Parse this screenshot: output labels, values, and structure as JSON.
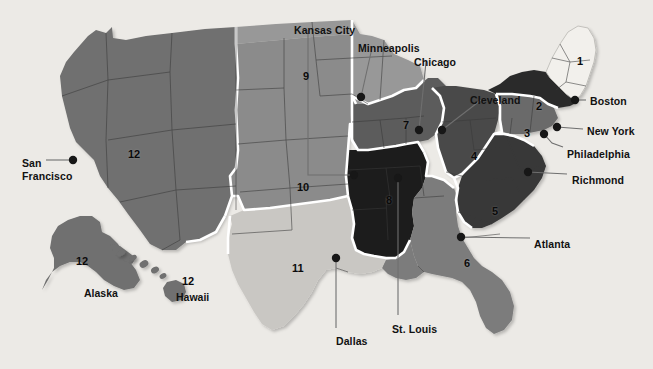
{
  "figure": {
    "kind": "map",
    "background_color": "#eceae6",
    "outline_color": "#ffffff",
    "state_border_color": "#3a3a3a",
    "marker_color": "#171717",
    "leader_line_color": "#6b6b6b"
  },
  "district_shades": {
    "1": "#f2f0ec",
    "2": "#2b2b2b",
    "3": "#6a6a6a",
    "4": "#4a4a4a",
    "5": "#383838",
    "6": "#7c7c7c",
    "7": "#5c5c5c",
    "8": "#1d1d1d",
    "9": "#989898",
    "10": "#8b8b8b",
    "11": "#c9c7c3",
    "12": "#6f6f6f"
  },
  "districts": [
    {
      "number": "1",
      "label_x": 577,
      "label_y": 55,
      "tone": "light"
    },
    {
      "number": "2",
      "label_x": 536,
      "label_y": 100,
      "tone": "dark"
    },
    {
      "number": "3",
      "label_x": 524,
      "label_y": 127,
      "tone": "dark"
    },
    {
      "number": "4",
      "label_x": 471,
      "label_y": 150,
      "tone": "dark"
    },
    {
      "number": "5",
      "label_x": 492,
      "label_y": 205,
      "tone": "dark"
    },
    {
      "number": "6",
      "label_x": 464,
      "label_y": 257,
      "tone": "dark"
    },
    {
      "number": "7",
      "label_x": 403,
      "label_y": 119,
      "tone": "dark"
    },
    {
      "number": "8",
      "label_x": 386,
      "label_y": 194,
      "tone": "dark"
    },
    {
      "number": "9",
      "label_x": 303,
      "label_y": 70,
      "tone": "light"
    },
    {
      "number": "10",
      "label_x": 297,
      "label_y": 181,
      "tone": "light"
    },
    {
      "number": "11",
      "label_x": 292,
      "label_y": 262,
      "tone": "light"
    },
    {
      "number": "12",
      "label_x": 128,
      "label_y": 148,
      "tone": "dark"
    }
  ],
  "inset_districts": [
    {
      "number": "12",
      "label_x": 76,
      "label_y": 255,
      "region": "alaska"
    },
    {
      "number": "12",
      "label_x": 182,
      "label_y": 275,
      "region": "hawaii"
    }
  ],
  "inset_labels": [
    {
      "name": "Alaska",
      "x": 84,
      "y": 287
    },
    {
      "name": "Hawaii",
      "x": 176,
      "y": 291
    }
  ],
  "cities": [
    {
      "name": "Kansas City",
      "label_x": 294,
      "label_y": 24,
      "dot_x": 354,
      "dot_y": 175,
      "anchor": "label-left"
    },
    {
      "name": "Minneapolis",
      "label_x": 358,
      "label_y": 42,
      "dot_x": 361,
      "dot_y": 97,
      "anchor": "label-left"
    },
    {
      "name": "Chicago",
      "label_x": 414,
      "label_y": 56,
      "dot_x": 419,
      "dot_y": 130,
      "anchor": "label-left"
    },
    {
      "name": "Cleveland",
      "label_x": 470,
      "label_y": 94,
      "dot_x": 442,
      "dot_y": 130,
      "anchor": "label-left"
    },
    {
      "name": "Boston",
      "label_x": 590,
      "label_y": 95,
      "dot_x": 575,
      "dot_y": 100,
      "anchor": "label-right"
    },
    {
      "name": "New York",
      "label_x": 587,
      "label_y": 125,
      "dot_x": 557,
      "dot_y": 127,
      "anchor": "label-right"
    },
    {
      "name": "Philadelphia",
      "label_x": 567,
      "label_y": 148,
      "dot_x": 544,
      "dot_y": 134,
      "anchor": "label-right"
    },
    {
      "name": "Richmond",
      "label_x": 572,
      "label_y": 174,
      "dot_x": 528,
      "dot_y": 172,
      "anchor": "label-right"
    },
    {
      "name": "Atlanta",
      "label_x": 534,
      "label_y": 238,
      "dot_x": 461,
      "dot_y": 237,
      "anchor": "label-right"
    },
    {
      "name": "St. Louis",
      "label_x": 392,
      "label_y": 323,
      "dot_x": 398,
      "dot_y": 178,
      "anchor": "label-below"
    },
    {
      "name": "Dallas",
      "label_x": 336,
      "label_y": 335,
      "dot_x": 336,
      "dot_y": 258,
      "anchor": "label-below"
    },
    {
      "name": "San Francisco",
      "label_x": 22,
      "label_y": 157,
      "dot_x": 73,
      "dot_y": 160,
      "anchor": "label-left-2line"
    }
  ],
  "city_labels_multiline": {
    "San Francisco": [
      "San",
      "Francisco"
    ]
  }
}
